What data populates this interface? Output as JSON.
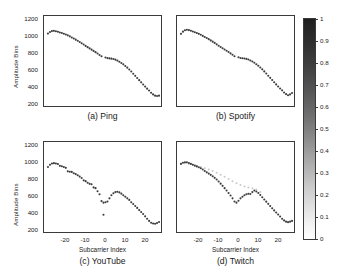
{
  "figure": {
    "colorbar": {
      "ticks": [
        "1",
        "0.9",
        "0.8",
        "0.7",
        "0.6",
        "0.5",
        "0.4",
        "0.3",
        "0.2",
        "0.1",
        "0"
      ],
      "min": 0,
      "max": 1,
      "colormap": "grayscale-inverted",
      "color_high": "#1f1f1f",
      "color_low": "#ffffff"
    },
    "axis": {
      "ylabel": "Amplitude Bins",
      "xlabel": "Subcarrier Index",
      "yticks": [
        "200",
        "400",
        "600",
        "800",
        "1000",
        "1200"
      ],
      "xticks": [
        "-20",
        "-10",
        "0",
        "10",
        "20"
      ],
      "ylim": [
        130,
        1280
      ],
      "xlim": [
        -30,
        29
      ]
    },
    "captions": {
      "a": "(a) Ping",
      "b": "(b) Spotify",
      "c": "(c) YouTube",
      "d": "(d) Twitch"
    }
  },
  "chart_data": {
    "type": "scatter",
    "title": "",
    "xlabel": "Subcarrier Index",
    "ylabel": "Amplitude Bins",
    "xlim": [
      -30,
      29
    ],
    "ylim": [
      130,
      1280
    ],
    "grid": false,
    "legend": null,
    "colorbar": {
      "label": "",
      "min": 0,
      "max": 1,
      "ticks": [
        0,
        0.1,
        0.2,
        0.3,
        0.4,
        0.5,
        0.6,
        0.7,
        0.8,
        0.9,
        1
      ]
    },
    "panels": [
      {
        "id": "a",
        "title": "(a) Ping",
        "x": [
          -28,
          -27,
          -26,
          -25,
          -24,
          -23,
          -22,
          -21,
          -20,
          -19,
          -18,
          -17,
          -16,
          -15,
          -14,
          -13,
          -12,
          -11,
          -10,
          -9,
          -8,
          -7,
          -6,
          -5,
          -4,
          -3,
          -2,
          -1,
          1,
          2,
          3,
          4,
          5,
          6,
          7,
          8,
          9,
          10,
          11,
          12,
          13,
          14,
          15,
          16,
          17,
          18,
          19,
          20,
          21,
          22,
          23,
          24,
          25,
          26,
          27,
          28
        ],
        "y": [
          1055,
          1075,
          1087,
          1090,
          1086,
          1078,
          1070,
          1062,
          1053,
          1044,
          1033,
          1020,
          1006,
          992,
          978,
          963,
          948,
          932,
          915,
          898,
          882,
          866,
          850,
          834,
          818,
          800,
          782,
          765,
          750,
          742,
          738,
          735,
          730,
          722,
          710,
          696,
          680,
          662,
          642,
          620,
          596,
          570,
          543,
          515,
          488,
          460,
          432,
          404,
          378,
          352,
          328,
          300,
          278,
          262,
          258,
          262,
          272
        ]
      },
      {
        "id": "b",
        "title": "(b) Spotify",
        "x": [
          -28,
          -27,
          -26,
          -25,
          -24,
          -23,
          -22,
          -21,
          -20,
          -19,
          -18,
          -17,
          -16,
          -15,
          -14,
          -13,
          -12,
          -11,
          -10,
          -9,
          -8,
          -7,
          -6,
          -5,
          -4,
          -3,
          -2,
          -1,
          1,
          2,
          3,
          4,
          5,
          6,
          7,
          8,
          9,
          10,
          11,
          12,
          13,
          14,
          15,
          16,
          17,
          18,
          19,
          20,
          21,
          22,
          23,
          24,
          25,
          26,
          27,
          28
        ],
        "y": [
          1052,
          1080,
          1098,
          1105,
          1100,
          1092,
          1082,
          1072,
          1062,
          1052,
          1040,
          1026,
          1012,
          998,
          984,
          968,
          952,
          936,
          918,
          900,
          884,
          868,
          852,
          836,
          820,
          802,
          784,
          766,
          752,
          744,
          740,
          737,
          732,
          724,
          712,
          698,
          682,
          664,
          644,
          622,
          598,
          572,
          545,
          517,
          490,
          462,
          434,
          406,
          380,
          354,
          330,
          302,
          282,
          268,
          278,
          296
        ]
      },
      {
        "id": "c",
        "title": "(c) YouTube",
        "x": [
          -28,
          -27,
          -26,
          -25,
          -24,
          -23,
          -22,
          -21,
          -20,
          -19,
          -18,
          -17,
          -16,
          -15,
          -14,
          -13,
          -12,
          -11,
          -10,
          -9,
          -8,
          -7,
          -6,
          -5,
          -4,
          -3,
          -2,
          -1,
          0,
          0,
          1,
          2,
          3,
          4,
          5,
          6,
          7,
          8,
          9,
          10,
          11,
          12,
          13,
          14,
          15,
          16,
          17,
          18,
          19,
          20,
          21,
          22,
          23,
          24,
          25,
          26,
          27,
          28
        ],
        "y": [
          960,
          990,
          1005,
          1010,
          1006,
          998,
          975,
          970,
          960,
          950,
          905,
          900,
          898,
          880,
          870,
          855,
          838,
          820,
          790,
          780,
          760,
          745,
          740,
          700,
          690,
          650,
          612,
          525,
          505,
          350,
          510,
          520,
          560,
          600,
          625,
          640,
          645,
          636,
          620,
          600,
          580,
          560,
          540,
          510,
          488,
          462,
          438,
          410,
          386,
          360,
          330,
          300,
          272,
          248,
          238,
          236,
          244,
          258
        ],
        "note": "outlier cluster near subcarrier index 0 with low-amplitude scatter points"
      },
      {
        "id": "d",
        "title": "(d) Twitch",
        "x": [
          -28,
          -27,
          -26,
          -25,
          -24,
          -23,
          -22,
          -21,
          -20,
          -19,
          -18,
          -17,
          -16,
          -15,
          -14,
          -13,
          -12,
          -11,
          -10,
          -9,
          -8,
          -7,
          -6,
          -5,
          -4,
          -3,
          -2,
          -1,
          0,
          1,
          2,
          3,
          4,
          5,
          6,
          7,
          8,
          9,
          10,
          11,
          12,
          13,
          14,
          15,
          16,
          17,
          18,
          19,
          20,
          21,
          22,
          23,
          24,
          25,
          26,
          27,
          28
        ],
        "y": [
          1000,
          1015,
          1022,
          1020,
          1012,
          1000,
          990,
          978,
          968,
          958,
          944,
          928,
          910,
          892,
          876,
          860,
          842,
          822,
          800,
          775,
          748,
          720,
          690,
          660,
          628,
          596,
          560,
          520,
          505,
          530,
          560,
          580,
          600,
          612,
          618,
          615,
          640,
          660,
          648,
          628,
          602,
          574,
          546,
          518,
          490,
          462,
          434,
          406,
          380,
          354,
          328,
          300,
          278,
          262,
          256,
          262,
          272
        ],
        "secondary_trace": {
          "name": "faded-upper-trace",
          "color": "#c9c9c9",
          "x": [
            -26,
            -24,
            -22,
            -20,
            -18,
            -16,
            -14,
            -12,
            -10,
            -8,
            -6,
            -4,
            -2,
            0,
            2,
            4,
            6,
            8,
            10,
            12
          ],
          "y": [
            1010,
            1000,
            988,
            975,
            960,
            945,
            928,
            908,
            886,
            862,
            836,
            808,
            780,
            752,
            730,
            712,
            700,
            690,
            672,
            640
          ]
        },
        "note": "faded light-gray trace overlays the dark main trace; scattered outliers near index 0"
      }
    ]
  }
}
